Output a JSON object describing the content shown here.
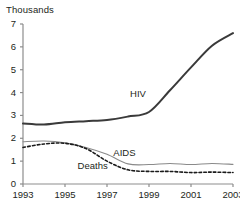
{
  "chart_data": {
    "type": "line",
    "title": "",
    "subtitle": "",
    "xlabel": "",
    "ylabel": "Thousands",
    "unit_label": "Thousands",
    "x": [
      1993,
      1994,
      1995,
      1996,
      1997,
      1998,
      1999,
      2000,
      2001,
      2002,
      2003
    ],
    "xlim": [
      1993,
      2003
    ],
    "ylim": [
      0,
      7
    ],
    "y_ticks": [
      0,
      1,
      2,
      3,
      4,
      5,
      6,
      7
    ],
    "x_ticks": [
      1993,
      1995,
      1997,
      1999,
      2001,
      2003
    ],
    "x_tick_labels": [
      "1993",
      "1995",
      "1997",
      "1999",
      "2001",
      "2003"
    ],
    "y_tick_labels": [
      "0",
      "1",
      "2",
      "3",
      "4",
      "5",
      "6",
      "7"
    ],
    "grid": false,
    "legend": "inline-annotations",
    "series": [
      {
        "name": "HIV",
        "label": "HIV",
        "style": "solid",
        "color": "#3a3a3a",
        "width": 2.0,
        "label_x": 1998.1,
        "label_y": 3.95,
        "values": [
          2.65,
          2.6,
          2.7,
          2.75,
          2.8,
          2.95,
          3.15,
          4.1,
          5.1,
          6.05,
          6.6
        ]
      },
      {
        "name": "AIDS",
        "label": "AIDS",
        "style": "solid",
        "color": "#8a8a8a",
        "width": 1.1,
        "label_x": 1997.3,
        "label_y": 1.35,
        "values": [
          1.85,
          1.88,
          1.8,
          1.6,
          1.3,
          0.88,
          0.85,
          0.9,
          0.85,
          0.9,
          0.86
        ]
      },
      {
        "name": "Deaths",
        "label": "Deaths",
        "style": "dashed",
        "color": "#1a1a1a",
        "width": 1.6,
        "label_x": 1995.6,
        "label_y": 0.78,
        "values": [
          1.6,
          1.75,
          1.78,
          1.55,
          1.0,
          0.62,
          0.55,
          0.55,
          0.5,
          0.52,
          0.5
        ]
      }
    ],
    "axis_color": "#8d8d8d",
    "text_color": "#231f20",
    "background": "#ffffff"
  }
}
